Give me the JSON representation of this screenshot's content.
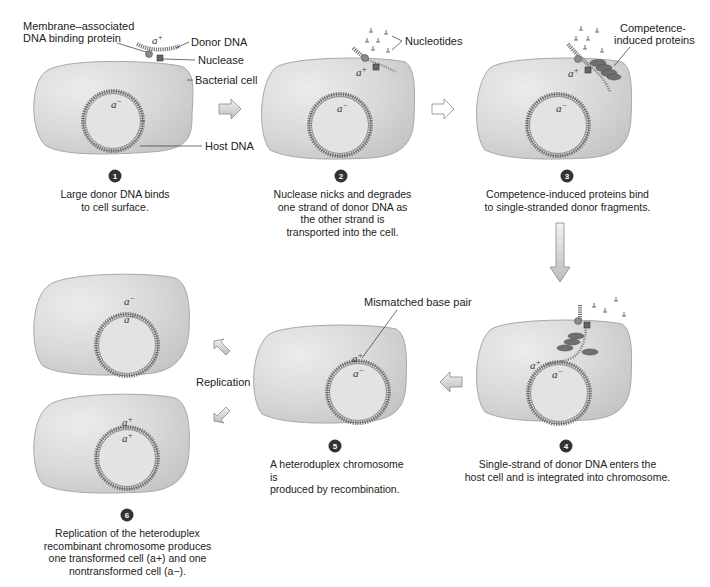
{
  "page_header": {
    "text": "· · ·",
    "page_number": "· · ·"
  },
  "colors": {
    "cell_fill": "#d8d8d8",
    "cell_edge": "#a9a9a9",
    "dna": "#6e6e6e",
    "arrow_fill": "#cfcfcf",
    "step_badge": "#333333",
    "protein": "#6f6f6f"
  },
  "steps": [
    {
      "number": "1",
      "caption_lines": [
        "Large donor DNA binds",
        "to cell surface."
      ],
      "labels": {
        "membrane_protein": [
          "Membrane–associated",
          "DNA binding protein"
        ],
        "donor_dna": "Donor DNA",
        "nuclease": "Nuclease",
        "bacterial_cell": "Bacterial cell",
        "host_dna": "Host DNA"
      },
      "alleles": {
        "donor": "a+",
        "host": "a−"
      }
    },
    {
      "number": "2",
      "caption_lines": [
        "Nuclease nicks and degrades",
        "one strand of donor DNA as",
        "the other strand is",
        "transported into the cell."
      ],
      "labels": {
        "nucleotides": "Nucleotides"
      },
      "alleles": {
        "donor": "a+",
        "host": "a−"
      }
    },
    {
      "number": "3",
      "caption_lines": [
        "Competence-induced proteins bind",
        "to single-stranded donor fragments."
      ],
      "labels": {
        "competence_proteins": [
          "Competence-",
          "induced proteins"
        ]
      },
      "alleles": {
        "donor": "a+",
        "host": "a−"
      }
    },
    {
      "number": "4",
      "caption_lines": [
        "Single-strand of donor DNA enters the",
        "host cell and is integrated into chromosome."
      ],
      "alleles": {
        "donor": "a+",
        "host": "a−"
      }
    },
    {
      "number": "5",
      "caption_lines": [
        "A heteroduplex chromosome is",
        "produced by recombination."
      ],
      "labels": {
        "mismatch": "Mismatched base pair"
      },
      "alleles": {
        "top": "a+",
        "bottom": "a−"
      }
    },
    {
      "number": "6",
      "caption_lines": [
        "Replication of the heteroduplex",
        "recombinant chromosome produces",
        "one transformed cell (a+) and one",
        "nontransformed cell (a−)."
      ],
      "labels": {
        "replication": "Replication"
      },
      "cells": [
        {
          "top": "a−",
          "bottom": "a−"
        },
        {
          "top": "a+",
          "bottom": "a+"
        }
      ]
    }
  ]
}
